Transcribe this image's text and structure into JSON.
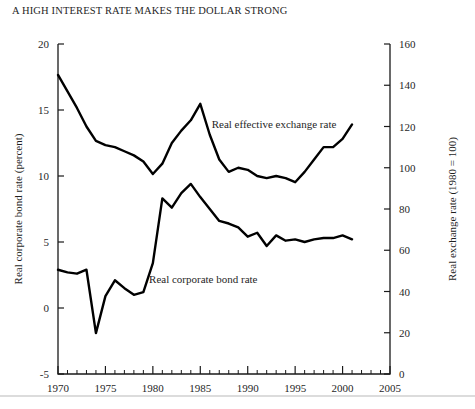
{
  "chart_data": {
    "type": "line",
    "title": "A HIGH INTEREST RATE MAKES THE DOLLAR STRONG",
    "xlabel": "",
    "ylabel": "Real corporate bond rate (percent)",
    "y2label": "Real exchange rate (1980 = 100)",
    "xlim": [
      1970,
      2005
    ],
    "ylim": [
      -5,
      20
    ],
    "y2lim": [
      0,
      160
    ],
    "xticks": [
      1970,
      1975,
      1980,
      1985,
      1990,
      1995,
      2000,
      2005
    ],
    "xtick_labels": [
      "1970",
      "1975",
      "1980",
      "1985",
      "1990",
      "1995",
      "2000",
      "2005"
    ],
    "xminor_step": 1,
    "yticks": [
      -5,
      0,
      5,
      10,
      15,
      20
    ],
    "ytick_labels": [
      "-5",
      "0",
      "5",
      "10",
      "15",
      "20"
    ],
    "y2ticks": [
      0,
      20,
      40,
      60,
      80,
      100,
      120,
      140,
      160
    ],
    "y2tick_labels": [
      "0",
      "20",
      "40",
      "60",
      "80",
      "100",
      "120",
      "140",
      "160"
    ],
    "grid": false,
    "legend_position": "inline-annotation",
    "line_color": "#000000",
    "series": [
      {
        "name": "Real effective exchange rate",
        "axis": "right",
        "label_x": 1986.2,
        "label_y": 121,
        "x": [
          1970,
          1971,
          1972,
          1973,
          1974,
          1975,
          1976,
          1977,
          1978,
          1979,
          1980,
          1981,
          1982,
          1983,
          1984,
          1985,
          1986,
          1987,
          1988,
          1989,
          1990,
          1991,
          1992,
          1993,
          1994,
          1995,
          1996,
          1997,
          1998,
          1999,
          2000,
          2001
        ],
        "y": [
          145,
          137,
          129,
          120,
          113,
          111,
          110,
          108,
          106,
          103,
          97,
          102,
          112,
          118,
          123,
          131,
          116,
          104,
          98,
          100,
          99,
          96,
          95,
          96,
          95,
          93,
          98,
          104,
          110,
          110,
          114,
          121
        ]
      },
      {
        "name": "Real corporate bond rate",
        "axis": "left",
        "label_x": 1979.6,
        "label_y": 2.2,
        "x": [
          1970,
          1971,
          1972,
          1973,
          1974,
          1975,
          1976,
          1977,
          1978,
          1979,
          1980,
          1981,
          1982,
          1983,
          1984,
          1985,
          1986,
          1987,
          1988,
          1989,
          1990,
          1991,
          1992,
          1993,
          1994,
          1995,
          1996,
          1997,
          1998,
          1999,
          2000,
          2001
        ],
        "y": [
          2.9,
          2.7,
          2.6,
          2.9,
          -1.9,
          0.9,
          2.1,
          1.5,
          1.0,
          1.2,
          3.4,
          8.3,
          7.6,
          8.7,
          9.4,
          8.4,
          7.5,
          6.6,
          6.4,
          6.1,
          5.4,
          5.7,
          4.7,
          5.5,
          5.1,
          5.2,
          5.0,
          5.2,
          5.3,
          5.3,
          5.5,
          5.2
        ]
      }
    ]
  }
}
